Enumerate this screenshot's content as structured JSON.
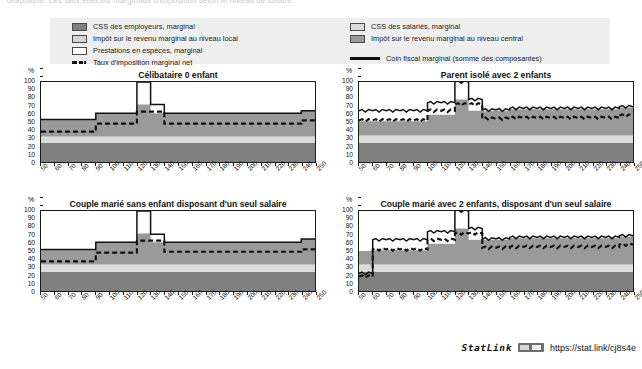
{
  "top_caption": "Graphique. Les taux effectifs marginaux d'imposition selon le niveau de salaire",
  "legend": {
    "left_items": [
      {
        "id": "employer-css",
        "swatch": "employer",
        "label": "CSS des employeurs, marginal"
      },
      {
        "id": "local-income-tax",
        "swatch": "local",
        "label": "Impôt sur le revenu marginal au niveau local"
      },
      {
        "id": "cash-benefits",
        "swatch": "prest",
        "label": "Prestations en espèces, marginal"
      }
    ],
    "left_line": {
      "id": "net-marginal-tax-rate",
      "style": "dashed",
      "label": "Taux d'imposition marginal net"
    },
    "right_items": [
      {
        "id": "employee-css",
        "swatch": "employee",
        "label": "CSS des salariés, marginal"
      },
      {
        "id": "central-income-tax",
        "swatch": "central",
        "label": "Impôt sur le revenu marginal au niveau central"
      }
    ],
    "right_line": {
      "id": "marginal-tax-wedge",
      "style": "solid",
      "label": "Coin fiscal marginal (somme des composantes)"
    }
  },
  "statlink": {
    "word": "StatLink",
    "url": "https://stat.link/cj8s4e"
  },
  "chart_data": {
    "type": "area",
    "xlabel": "",
    "ylabel": "%",
    "ylim": [
      0,
      100
    ],
    "xlim": [
      50,
      250
    ],
    "yticks": [
      0,
      10,
      20,
      30,
      40,
      50,
      60,
      70,
      80,
      90,
      100
    ],
    "xticks": [
      50,
      60,
      70,
      80,
      90,
      100,
      110,
      120,
      130,
      140,
      150,
      160,
      170,
      180,
      190,
      200,
      210,
      220,
      230,
      240,
      250
    ],
    "grid": false,
    "legend_position": "top",
    "series_colors": {
      "employer_css": "#808080",
      "employee_css": "#dcdcdc",
      "central_income_tax": "#9a9a9a",
      "local_income_tax": "#d4d4d4",
      "cash_benefits": "#ffffff",
      "net_marginal_tax_rate": "#111111",
      "marginal_tax_wedge": "#111111"
    },
    "panels": [
      {
        "id": "celibataire-0-enfant",
        "title": "Célibataire 0 enfant",
        "x": [
          50,
          60,
          70,
          80,
          90,
          100,
          110,
          120,
          130,
          140,
          150,
          160,
          170,
          180,
          190,
          200,
          210,
          220,
          230,
          240,
          250
        ],
        "series": [
          {
            "name": "CSS des employeurs, marginal",
            "key": "employer_css",
            "values": [
              24,
              24,
              24,
              24,
              24,
              24,
              24,
              24,
              24,
              24,
              24,
              24,
              24,
              24,
              24,
              24,
              24,
              24,
              24,
              24,
              24
            ]
          },
          {
            "name": "CSS des salariés, marginal",
            "key": "employee_css",
            "values": [
              8,
              8,
              8,
              8,
              8,
              8,
              8,
              8,
              8,
              8,
              8,
              8,
              8,
              8,
              8,
              8,
              8,
              8,
              8,
              8,
              8
            ]
          },
          {
            "name": "Impôt sur le revenu marginal au niveau central",
            "key": "central_income_tax",
            "values": [
              21,
              21,
              21,
              21,
              29,
              29,
              29,
              40,
              29,
              29,
              29,
              29,
              29,
              29,
              29,
              29,
              29,
              29,
              29,
              32,
              32
            ]
          },
          {
            "name": "Impôt sur le revenu marginal au niveau local",
            "key": "local_income_tax",
            "values": [
              0,
              0,
              0,
              0,
              0,
              0,
              0,
              0,
              0,
              0,
              0,
              0,
              0,
              0,
              0,
              0,
              0,
              0,
              0,
              0,
              0
            ]
          },
          {
            "name": "Prestations en espèces, marginal",
            "key": "cash_benefits",
            "values": [
              0,
              0,
              0,
              0,
              0,
              0,
              0,
              0,
              0,
              0,
              0,
              0,
              0,
              0,
              0,
              0,
              0,
              0,
              0,
              0,
              0
            ]
          }
        ],
        "lines": [
          {
            "name": "Coin fiscal marginal (somme des composantes)",
            "key": "marginal_tax_wedge",
            "values": [
              53,
              53,
              53,
              53,
              61,
              61,
              61,
              100,
              72,
              61,
              61,
              61,
              61,
              61,
              61,
              61,
              61,
              61,
              61,
              64,
              64
            ]
          },
          {
            "name": "Taux d'imposition marginal net",
            "key": "net_marginal_tax_rate",
            "values": [
              38,
              38,
              38,
              38,
              48,
              48,
              48,
              63,
              63,
              48,
              48,
              48,
              48,
              48,
              48,
              48,
              48,
              48,
              48,
              52,
              52
            ]
          }
        ]
      },
      {
        "id": "parent-isole-2-enfants",
        "title": "Parent isolé avec 2 enfants",
        "x": [
          50,
          60,
          70,
          80,
          90,
          100,
          110,
          120,
          130,
          140,
          150,
          160,
          170,
          180,
          190,
          200,
          210,
          220,
          230,
          240,
          250
        ],
        "series": [
          {
            "name": "CSS des employeurs, marginal",
            "key": "employer_css",
            "values": [
              24,
              24,
              24,
              24,
              24,
              24,
              24,
              24,
              24,
              24,
              24,
              24,
              24,
              24,
              24,
              24,
              24,
              24,
              24,
              24,
              24
            ]
          },
          {
            "name": "CSS des salariés, marginal",
            "key": "employee_css",
            "values": [
              9,
              9,
              9,
              9,
              9,
              9,
              9,
              9,
              9,
              9,
              9,
              9,
              9,
              9,
              9,
              9,
              9,
              9,
              9,
              9,
              9
            ]
          },
          {
            "name": "Impôt sur le revenu marginal au niveau central",
            "key": "central_income_tax",
            "values": [
              18,
              18,
              18,
              18,
              18,
              26,
              26,
              45,
              31,
              31,
              31,
              33,
              33,
              33,
              33,
              33,
              33,
              33,
              33,
              35,
              35
            ]
          },
          {
            "name": "Impôt sur le revenu marginal au niveau local",
            "key": "local_income_tax",
            "values": [
              0,
              0,
              0,
              0,
              0,
              0,
              0,
              0,
              0,
              0,
              0,
              0,
              0,
              0,
              0,
              0,
              0,
              0,
              0,
              0,
              0
            ]
          },
          {
            "name": "Prestations en espèces, marginal",
            "key": "cash_benefits",
            "values": [
              0,
              0,
              0,
              0,
              0,
              0,
              0,
              0,
              0,
              0,
              0,
              0,
              0,
              0,
              0,
              0,
              0,
              0,
              0,
              0,
              0
            ]
          }
        ],
        "lines": [
          {
            "name": "Coin fiscal marginal (somme des composantes)",
            "key": "marginal_tax_wedge",
            "values": [
              64,
              64,
              64,
              64,
              64,
              74,
              74,
              100,
              78,
              65,
              65,
              67,
              67,
              67,
              67,
              67,
              67,
              67,
              67,
              69,
              69
            ]
          },
          {
            "name": "Taux d'imposition marginal net",
            "key": "net_marginal_tax_rate",
            "values": [
              52,
              52,
              52,
              52,
              52,
              64,
              64,
              72,
              72,
              54,
              54,
              55,
              55,
              55,
              55,
              55,
              55,
              55,
              55,
              58,
              58
            ]
          }
        ]
      },
      {
        "id": "couple-marie-sans-enfant-un-salaire",
        "title": "Couple marié sans enfant disposant d'un seul salaire",
        "x": [
          50,
          60,
          70,
          80,
          90,
          100,
          110,
          120,
          130,
          140,
          150,
          160,
          170,
          180,
          190,
          200,
          210,
          220,
          230,
          240,
          250
        ],
        "series": [
          {
            "name": "CSS des employeurs, marginal",
            "key": "employer_css",
            "values": [
              24,
              24,
              24,
              24,
              24,
              24,
              24,
              24,
              24,
              24,
              24,
              24,
              24,
              24,
              24,
              24,
              24,
              24,
              24,
              24,
              24
            ]
          },
          {
            "name": "CSS des salariés, marginal",
            "key": "employee_css",
            "values": [
              9,
              9,
              9,
              9,
              9,
              9,
              9,
              9,
              9,
              9,
              9,
              9,
              9,
              9,
              9,
              9,
              9,
              9,
              9,
              9,
              9
            ]
          },
          {
            "name": "Impôt sur le revenu marginal au niveau central",
            "key": "central_income_tax",
            "values": [
              19,
              19,
              19,
              19,
              28,
              28,
              28,
              39,
              28,
              28,
              28,
              28,
              28,
              28,
              28,
              28,
              28,
              28,
              28,
              32,
              32
            ]
          },
          {
            "name": "Impôt sur le revenu marginal au niveau local",
            "key": "local_income_tax",
            "values": [
              0,
              0,
              0,
              0,
              0,
              0,
              0,
              0,
              0,
              0,
              0,
              0,
              0,
              0,
              0,
              0,
              0,
              0,
              0,
              0,
              0
            ]
          },
          {
            "name": "Prestations en espèces, marginal",
            "key": "cash_benefits",
            "values": [
              0,
              0,
              0,
              0,
              0,
              0,
              0,
              0,
              0,
              0,
              0,
              0,
              0,
              0,
              0,
              0,
              0,
              0,
              0,
              0,
              0
            ]
          }
        ],
        "lines": [
          {
            "name": "Coin fiscal marginal (somme des composantes)",
            "key": "marginal_tax_wedge",
            "values": [
              52,
              52,
              52,
              52,
              61,
              61,
              61,
              100,
              71,
              61,
              61,
              61,
              61,
              61,
              61,
              61,
              61,
              61,
              61,
              65,
              65
            ]
          },
          {
            "name": "Taux d'imposition marginal net",
            "key": "net_marginal_tax_rate",
            "values": [
              37,
              37,
              37,
              37,
              48,
              48,
              48,
              63,
              63,
              49,
              49,
              49,
              49,
              49,
              49,
              49,
              49,
              49,
              49,
              52,
              52
            ]
          }
        ]
      },
      {
        "id": "couple-marie-2-enfants-un-salaire",
        "title": "Couple marié avec 2 enfants, disposant d'un seul salaire",
        "x": [
          50,
          60,
          70,
          80,
          90,
          100,
          110,
          120,
          130,
          140,
          150,
          160,
          170,
          180,
          190,
          200,
          210,
          220,
          230,
          240,
          250
        ],
        "series": [
          {
            "name": "CSS des employeurs, marginal",
            "key": "employer_css",
            "values": [
              24,
              24,
              24,
              24,
              24,
              24,
              24,
              24,
              24,
              24,
              24,
              24,
              24,
              24,
              24,
              24,
              24,
              24,
              24,
              24,
              24
            ]
          },
          {
            "name": "CSS des salariés, marginal",
            "key": "employee_css",
            "values": [
              9,
              9,
              9,
              9,
              9,
              9,
              9,
              9,
              9,
              9,
              9,
              9,
              9,
              9,
              9,
              9,
              9,
              9,
              9,
              9,
              9
            ]
          },
          {
            "name": "Impôt sur le revenu marginal au niveau central",
            "key": "central_income_tax",
            "values": [
              17,
              18,
              18,
              18,
              18,
              26,
              26,
              45,
              31,
              31,
              31,
              33,
              33,
              33,
              33,
              33,
              33,
              33,
              33,
              35,
              35
            ]
          },
          {
            "name": "Impôt sur le revenu marginal au niveau local",
            "key": "local_income_tax",
            "values": [
              0,
              0,
              0,
              0,
              0,
              0,
              0,
              0,
              0,
              0,
              0,
              0,
              0,
              0,
              0,
              0,
              0,
              0,
              0,
              0,
              0
            ]
          },
          {
            "name": "Prestations en espèces, marginal",
            "key": "cash_benefits",
            "values": [
              0,
              0,
              0,
              0,
              0,
              0,
              0,
              0,
              0,
              0,
              0,
              0,
              0,
              0,
              0,
              0,
              0,
              0,
              0,
              0,
              0
            ]
          }
        ],
        "lines": [
          {
            "name": "Coin fiscal marginal (somme des composantes)",
            "key": "marginal_tax_wedge",
            "values": [
              22,
              64,
              64,
              64,
              64,
              74,
              74,
              100,
              78,
              65,
              65,
              67,
              67,
              67,
              67,
              67,
              67,
              67,
              67,
              69,
              69
            ]
          },
          {
            "name": "Taux d'imposition marginal net",
            "key": "net_marginal_tax_rate",
            "values": [
              18,
              52,
              52,
              52,
              52,
              64,
              64,
              72,
              72,
              54,
              54,
              55,
              55,
              55,
              55,
              55,
              55,
              55,
              55,
              58,
              58
            ]
          }
        ]
      }
    ]
  }
}
